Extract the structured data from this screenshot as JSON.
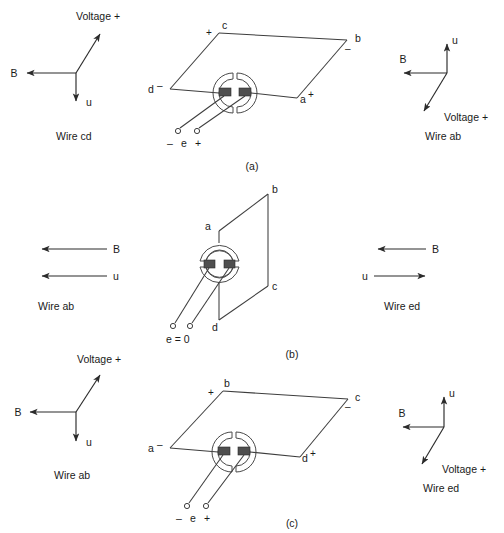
{
  "figure": {
    "type": "physics-diagram",
    "panels": [
      "a",
      "b",
      "c"
    ]
  },
  "panel_a": {
    "caption": "(a)",
    "loop": {
      "corner_top_left": "c",
      "corner_top_left_sign": "+",
      "corner_top_right": "b",
      "corner_top_right_sign": "–",
      "corner_left": "d",
      "corner_left_sign": "–",
      "corner_right": "a",
      "corner_right_sign": "+"
    },
    "terminals": {
      "minus": "–",
      "emf": "e",
      "plus": "+"
    },
    "left_triad": {
      "b_label": "B",
      "u_label": "u",
      "voltage_label": "Voltage +",
      "caption": "Wire cd",
      "b_dir": "left",
      "u_dir": "down",
      "voltage_dir": "up-right"
    },
    "right_triad": {
      "b_label": "B",
      "u_label": "u",
      "voltage_label": "Voltage +",
      "caption": "Wire ab",
      "b_dir": "left",
      "u_dir": "up",
      "voltage_dir": "down-left"
    }
  },
  "panel_b": {
    "caption": "(b)",
    "loop": {
      "corner_top": "b",
      "corner_upper_left": "a",
      "corner_lower_right": "c",
      "corner_bottom": "d"
    },
    "terminals": {
      "emf_text": "e = 0"
    },
    "left_triad": {
      "b_label": "B",
      "u_label": "u",
      "caption": "Wire ab",
      "b_dir": "left",
      "u_dir": "left"
    },
    "right_triad": {
      "b_label": "B",
      "u_label": "u",
      "caption": "Wire ed",
      "b_dir": "left",
      "u_dir": "right"
    }
  },
  "panel_c": {
    "caption": "(c)",
    "loop": {
      "corner_top_left": "b",
      "corner_top_left_sign": "+",
      "corner_top_right": "c",
      "corner_top_right_sign": "–",
      "corner_left": "a",
      "corner_left_sign": "–",
      "corner_right": "d",
      "corner_right_sign": "+"
    },
    "terminals": {
      "minus": "–",
      "emf": "e",
      "plus": "+"
    },
    "left_triad": {
      "b_label": "B",
      "u_label": "u",
      "voltage_label": "Voltage +",
      "caption": "Wire ab",
      "b_dir": "left",
      "u_dir": "down",
      "voltage_dir": "up-right"
    },
    "right_triad": {
      "b_label": "B",
      "u_label": "u",
      "voltage_label": "Voltage +",
      "caption": "Wire ed",
      "b_dir": "left",
      "u_dir": "up",
      "voltage_dir": "down-left"
    }
  },
  "colors": {
    "line": "#3d3d3d",
    "text": "#1a1a1a",
    "brush": "#4f4f4f",
    "background": "#ffffff"
  }
}
